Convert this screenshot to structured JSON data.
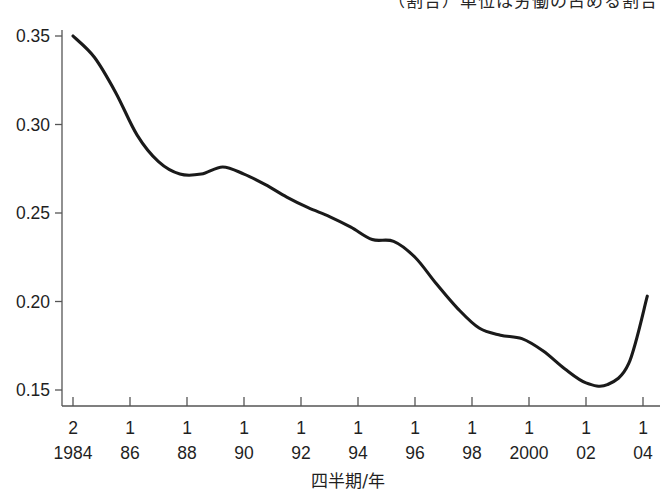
{
  "figure": {
    "cut_off_header_text": "（割合）単位は労働の占める割合",
    "background_color": "#ffffff",
    "line_color": "#1a1a1a",
    "axis_color": "#555555"
  },
  "chart_data": {
    "type": "line",
    "title": "",
    "subtitle": "",
    "xlabel": "四半期/年",
    "ylabel": "",
    "grid": false,
    "legend": null,
    "ylim": [
      0.15,
      0.35
    ],
    "yticks": [
      "0.15",
      "0.20",
      "0.25",
      "0.30",
      "0.35"
    ],
    "ytick_values": [
      0.15,
      0.2,
      0.25,
      0.3,
      0.35
    ],
    "xticks": [
      {
        "quarter": "2",
        "year": "1984"
      },
      {
        "quarter": "1",
        "year": "86"
      },
      {
        "quarter": "1",
        "year": "88"
      },
      {
        "quarter": "1",
        "year": "90"
      },
      {
        "quarter": "1",
        "year": "92"
      },
      {
        "quarter": "1",
        "year": "94"
      },
      {
        "quarter": "1",
        "year": "96"
      },
      {
        "quarter": "1",
        "year": "98"
      },
      {
        "quarter": "1",
        "year": "2000"
      },
      {
        "quarter": "1",
        "year": "02"
      },
      {
        "quarter": "1",
        "year": "04"
      }
    ],
    "xlim": [
      1984.25,
      2004.4
    ],
    "series": [
      {
        "name": "ratio",
        "x": [
          1984.25,
          1985.0,
          1985.75,
          1986.5,
          1987.25,
          1988.0,
          1988.75,
          1989.5,
          1990.25,
          1991.0,
          1991.75,
          1992.5,
          1993.25,
          1994.0,
          1994.75,
          1995.5,
          1996.25,
          1997.0,
          1997.75,
          1998.5,
          1999.25,
          2000.0,
          2000.75,
          2001.5,
          2002.25,
          2003.0,
          2003.75,
          2004.4
        ],
        "values": [
          0.35,
          0.338,
          0.318,
          0.294,
          0.279,
          0.272,
          0.272,
          0.276,
          0.272,
          0.266,
          0.259,
          0.253,
          0.248,
          0.242,
          0.235,
          0.234,
          0.225,
          0.21,
          0.196,
          0.185,
          0.181,
          0.179,
          0.172,
          0.162,
          0.154,
          0.153,
          0.165,
          0.203
        ]
      }
    ],
    "annotations": {
      "start_value": 0.35,
      "local_min_1": 0.272,
      "local_max_1": 0.276,
      "shoulder": 0.235,
      "plateau": 0.18,
      "global_min": 0.153,
      "end_value": 0.203
    }
  }
}
